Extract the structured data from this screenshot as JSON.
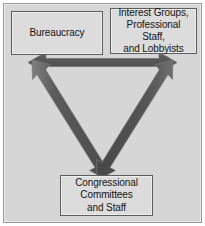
{
  "diagram": {
    "name": "iron-triangle",
    "type": "triangle-relationship-diagram",
    "background_color": "#d6d6d6",
    "frame_color": "#9a9a9a",
    "node_fill_color": "#dcdcdc",
    "node_border_color": "#5d5d5d",
    "arrow_fill_color": "#555555",
    "arrow_edge_color": "#7d7d7d",
    "nodes": [
      {
        "id": "bureaucracy",
        "label": "Bureaucracy",
        "position": "top-left"
      },
      {
        "id": "interest-groups",
        "label": "Interest Groups,\nProfessional Staff,\nand Lobbyists",
        "position": "top-right"
      },
      {
        "id": "congressional",
        "label": "Congressional\nCommittees\nand Staff",
        "position": "bottom-center"
      }
    ],
    "connectors": [
      {
        "id": "top-connector",
        "from": "bureaucracy",
        "to": "interest-groups",
        "style": "double-headed-arrow",
        "orientation": "horizontal"
      },
      {
        "id": "left-connector",
        "from": "bureaucracy",
        "to": "congressional",
        "style": "double-headed-arrow",
        "orientation": "diagonal"
      },
      {
        "id": "right-connector",
        "from": "interest-groups",
        "to": "congressional",
        "style": "double-headed-arrow",
        "orientation": "diagonal"
      }
    ]
  }
}
